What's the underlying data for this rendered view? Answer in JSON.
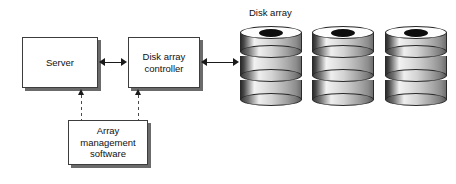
{
  "diagram": {
    "title_label": "Disk array",
    "nodes": {
      "server": {
        "label": "Server"
      },
      "controller": {
        "lines": [
          "Disk array",
          "controller"
        ]
      },
      "array_management_software": {
        "lines": [
          "Array",
          "management",
          "software"
        ]
      }
    },
    "connections": [
      {
        "name": "server-controller",
        "style": "solid",
        "arrowheads": "both"
      },
      {
        "name": "controller-disk-array",
        "style": "solid",
        "arrowheads": "both"
      },
      {
        "name": "ams-server",
        "style": "dashed",
        "arrowheads": "up"
      },
      {
        "name": "ams-controller",
        "style": "dashed",
        "arrowheads": "up"
      }
    ],
    "disk_array": {
      "stack_count": 3,
      "platters_per_stack": 3
    },
    "colors": {
      "outline": "#3d3d3d",
      "shadow": "#6b6b6b",
      "arrow": "#1a1a1a",
      "hole": "#0d0d0d",
      "background": "#ffffff"
    }
  }
}
